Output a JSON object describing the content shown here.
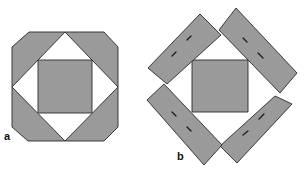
{
  "figure": {
    "panels": [
      {
        "id": "a",
        "label": "a",
        "description": "Square-in-a-square block: octagonal outer frame with white diamond and grey center square"
      },
      {
        "id": "b",
        "label": "b",
        "description": "Center grey square surrounded by four rotated rectangular strips with dashed seam marks"
      }
    ],
    "colors": {
      "fabric": "#9a9a9a",
      "outline": "#2a2a2a",
      "background": "#ffffff"
    }
  }
}
